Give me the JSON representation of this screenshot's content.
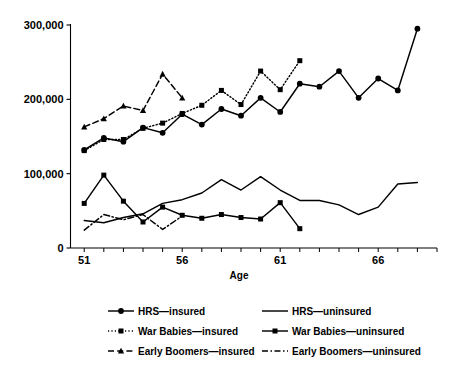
{
  "chart_data": {
    "type": "line",
    "title": "",
    "xlabel": "Age",
    "ylabel": "",
    "xlim": [
      50.3,
      69.0
    ],
    "ylim": [
      0,
      300000
    ],
    "xticks": [
      51,
      56,
      61,
      66
    ],
    "xtick_labels": [
      "51",
      "56",
      "61",
      "66"
    ],
    "xminor_step": 1,
    "yticks": [
      0,
      100000,
      200000,
      300000
    ],
    "ytick_labels": [
      "0",
      "100,000",
      "200,000",
      "300,000"
    ],
    "grid": false,
    "legend_position": "below",
    "series": [
      {
        "name": "HRS—insured",
        "style": "solid",
        "marker": "circle",
        "x": [
          51,
          52,
          53,
          54,
          55,
          56,
          57,
          58,
          59,
          60,
          61,
          62,
          63,
          64,
          65,
          66,
          67,
          68
        ],
        "y": [
          132000,
          148000,
          143000,
          162000,
          155000,
          180000,
          166000,
          187000,
          178000,
          202000,
          183000,
          221000,
          217000,
          238000,
          202000,
          228000,
          212000,
          295000
        ]
      },
      {
        "name": "HRS—uninsured",
        "style": "solid",
        "marker": "none",
        "x": [
          51,
          52,
          53,
          54,
          55,
          56,
          57,
          58,
          59,
          60,
          61,
          62,
          63,
          64,
          65,
          66,
          67,
          68
        ],
        "y": [
          37000,
          34000,
          41000,
          46000,
          60000,
          65000,
          74000,
          92000,
          78000,
          96000,
          78000,
          64000,
          64000,
          58000,
          45000,
          55000,
          86000,
          88000
        ]
      },
      {
        "name": "War Babies—insured",
        "style": "dotted",
        "marker": "square",
        "x": [
          51,
          52,
          53,
          54,
          55,
          56,
          57,
          58,
          59,
          60,
          61,
          62
        ],
        "y": [
          131000,
          146000,
          146000,
          161000,
          168000,
          181000,
          192000,
          212000,
          193000,
          238000,
          213000,
          252000
        ]
      },
      {
        "name": "War Babies—uninsured",
        "style": "solid",
        "marker": "square",
        "x": [
          51,
          52,
          53,
          54,
          55,
          56,
          57,
          58,
          59,
          60,
          61,
          62
        ],
        "y": [
          60000,
          98000,
          63000,
          35000,
          55000,
          44000,
          40000,
          45000,
          41000,
          39000,
          61000,
          26000
        ]
      },
      {
        "name": "Early Boomers—insured",
        "style": "dashed",
        "marker": "triangle",
        "x": [
          51,
          52,
          53,
          54,
          55,
          56
        ],
        "y": [
          163000,
          174000,
          191000,
          185000,
          234000,
          202000
        ]
      },
      {
        "name": "Early Boomers—uninsured",
        "style": "dashdot",
        "marker": "none",
        "x": [
          51,
          52,
          53,
          54,
          55,
          56
        ],
        "y": [
          24000,
          45000,
          38000,
          45000,
          25000,
          43000
        ]
      }
    ]
  },
  "axes": {
    "x_axis_title": "Age",
    "y_tick_labels": [
      "300,000",
      "200,000",
      "100,000",
      "0"
    ],
    "x_tick_labels": [
      "51",
      "56",
      "61",
      "66"
    ]
  },
  "legend": {
    "entries": [
      {
        "label": "HRS—insured",
        "style": "solid",
        "marker": "circle",
        "col": 0,
        "row": 0
      },
      {
        "label": "HRS—uninsured",
        "style": "solid",
        "marker": "none",
        "col": 1,
        "row": 0
      },
      {
        "label": "War Babies—insured",
        "style": "dotted",
        "marker": "square",
        "col": 0,
        "row": 1
      },
      {
        "label": "War Babies—uninsured",
        "style": "solid",
        "marker": "square",
        "col": 1,
        "row": 1
      },
      {
        "label": "Early Boomers—insured",
        "style": "dashed",
        "marker": "triangle",
        "col": 0,
        "row": 2
      },
      {
        "label": "Early Boomers—uninsured",
        "style": "dashdot",
        "marker": "none",
        "col": 1,
        "row": 2
      }
    ]
  },
  "colors": {
    "line": "#000000",
    "axis": "#000000",
    "background": "#ffffff"
  }
}
